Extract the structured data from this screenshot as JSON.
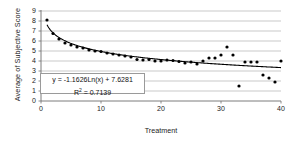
{
  "chart_data": {
    "type": "scatter",
    "title": "",
    "xlabel": "Treatment",
    "ylabel": "Average of Subjective Score",
    "xlim": [
      0,
      40
    ],
    "ylim": [
      0,
      9
    ],
    "xticks": [
      0,
      10,
      20,
      30,
      40
    ],
    "yticks": [
      0,
      1,
      2,
      3,
      4,
      5,
      6,
      7,
      8,
      9
    ],
    "grid": "horizontal",
    "legend": "none",
    "marker_color": "#000000",
    "trendline_color": "#000000",
    "gridline_color": "#b3b3b3",
    "series": [
      {
        "name": "Average of Subjective Score",
        "x": [
          1,
          2,
          3,
          4,
          5,
          6,
          7,
          8,
          9,
          10,
          11,
          12,
          13,
          14,
          15,
          16,
          17,
          18,
          19,
          20,
          21,
          22,
          23,
          24,
          25,
          26,
          27,
          28,
          29,
          30,
          31,
          32,
          33,
          34,
          35,
          36,
          37,
          38,
          39,
          40
        ],
        "y": [
          8.1,
          6.75,
          6.2,
          5.8,
          5.6,
          5.4,
          5.3,
          5.1,
          5.0,
          4.95,
          4.8,
          4.7,
          4.6,
          4.5,
          4.4,
          4.15,
          4.1,
          4.15,
          4.0,
          4.0,
          4.1,
          4.05,
          3.95,
          3.8,
          3.9,
          3.7,
          4.0,
          4.3,
          4.3,
          4.6,
          5.4,
          4.6,
          1.5,
          3.9,
          3.9,
          3.9,
          2.6,
          2.3,
          1.9,
          4.0
        ]
      }
    ],
    "trendline": {
      "equation": "y = -1.1626Ln(x) + 7.6281",
      "r_squared_label": "R",
      "r_squared_exp": "2",
      "r_squared_value": "= 0.7139",
      "coefficient": -1.1626,
      "intercept": 7.6281,
      "r_squared": 0.7139,
      "model": "logarithmic"
    },
    "annotations": [
      {
        "text": "y = -1.1626Ln(x) + 7.6281"
      },
      {
        "text": "R2 = 0.7139"
      }
    ]
  }
}
